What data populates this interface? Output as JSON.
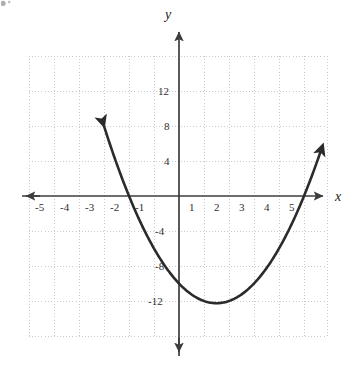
{
  "figure": {
    "background_color": "#ffffff",
    "axis_color": "#3d3d3d",
    "grid_color": "#c9c9cf",
    "curve_color": "#2b2b2b",
    "label_color": "#2e2e2e",
    "axis_label_x": "x",
    "axis_label_y": "y"
  },
  "chart_data": {
    "type": "line",
    "title": "",
    "xlabel": "x",
    "ylabel": "y",
    "xlim": [
      -6.0,
      6.2
    ],
    "ylim": [
      -17.0,
      16.5
    ],
    "grid": true,
    "grid_style": "dotted",
    "grid_x_step": 1,
    "grid_y_step": 4,
    "legend": "none",
    "x_tick_labels": [
      "-5",
      "-4",
      "-3",
      "-2",
      "-1",
      "1",
      "2",
      "3",
      "4",
      "5"
    ],
    "x_tick_values": [
      -5,
      -4,
      -3,
      -2,
      -1,
      1,
      2,
      3,
      4,
      5
    ],
    "y_tick_labels": [
      "12",
      "8",
      "4",
      "-4",
      "-8",
      "-12"
    ],
    "y_tick_values": [
      12,
      8,
      4,
      -4,
      -8,
      -12
    ],
    "curve": {
      "name": "parabola",
      "equation": "y = x^2 - 3x - 10",
      "coefficients": {
        "a": 1,
        "b": -3,
        "c": -10
      },
      "vertex": [
        1.5,
        -12.25
      ],
      "roots": [
        -2,
        5
      ],
      "y_intercept": -10,
      "x_domain": [
        -3.05,
        5.7
      ],
      "arrow_start": true,
      "arrow_end": true,
      "x": [
        -3.05,
        -2.8,
        -2.5,
        -2.2,
        -2.0,
        -1.7,
        -1.4,
        -1.1,
        -0.8,
        -0.5,
        -0.2,
        0.0,
        0.3,
        0.6,
        0.9,
        1.2,
        1.5,
        1.8,
        2.1,
        2.4,
        2.7,
        3.0,
        3.3,
        3.6,
        3.9,
        4.2,
        4.5,
        4.8,
        5.0,
        5.3,
        5.7
      ],
      "y": [
        8.45,
        6.24,
        3.75,
        1.44,
        0.0,
        -2.01,
        -3.84,
        -5.49,
        -6.96,
        -8.25,
        -9.36,
        -10.0,
        -10.81,
        -11.44,
        -11.89,
        -12.16,
        -12.25,
        -12.16,
        -11.89,
        -11.44,
        -10.81,
        -10.0,
        -9.01,
        -7.84,
        -6.49,
        -4.96,
        -3.25,
        -1.36,
        0.0,
        1.99,
        5.19
      ]
    }
  },
  "ticks": {
    "x": [
      {
        "label": "-5",
        "value": -5
      },
      {
        "label": "-4",
        "value": -4
      },
      {
        "label": "-3",
        "value": -3
      },
      {
        "label": "-2",
        "value": -2
      },
      {
        "label": "-1",
        "value": -1
      },
      {
        "label": "1",
        "value": 1
      },
      {
        "label": "2",
        "value": 2
      },
      {
        "label": "3",
        "value": 3
      },
      {
        "label": "4",
        "value": 4
      },
      {
        "label": "5",
        "value": 5
      }
    ],
    "y": [
      {
        "label": "12",
        "value": 12
      },
      {
        "label": "8",
        "value": 8
      },
      {
        "label": "4",
        "value": 4
      },
      {
        "label": "-4",
        "value": -4
      },
      {
        "label": "-8",
        "value": -8
      },
      {
        "label": "-12",
        "value": -12
      }
    ]
  }
}
